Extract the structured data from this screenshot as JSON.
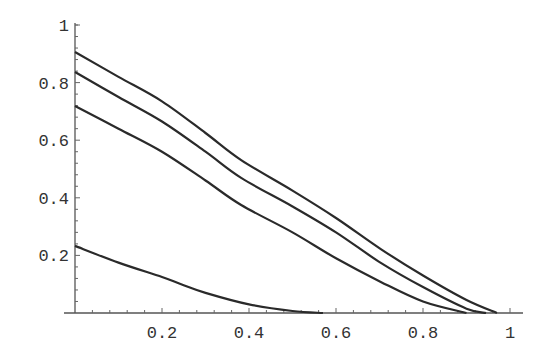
{
  "chart_data": {
    "type": "line",
    "title": "",
    "xlabel": "",
    "ylabel": "",
    "xlim": [
      0,
      1
    ],
    "ylim": [
      0,
      1
    ],
    "grid": false,
    "legend": null,
    "x_ticks": [
      "0.2",
      "0.4",
      "0.6",
      "0.8",
      "1"
    ],
    "y_ticks": [
      "0.2",
      "0.4",
      "0.6",
      "0.8",
      "1"
    ],
    "x_tick_values": [
      0.2,
      0.4,
      0.6,
      0.8,
      1.0
    ],
    "y_tick_values": [
      0.2,
      0.4,
      0.6,
      0.8,
      1.0
    ],
    "series": [
      {
        "name": "curve-1",
        "x": [
          0,
          0.1,
          0.2,
          0.3,
          0.382,
          0.5,
          0.6,
          0.703,
          0.8,
          0.9,
          0.97
        ],
        "y": [
          0.906,
          0.82,
          0.735,
          0.625,
          0.531,
          0.425,
          0.33,
          0.222,
          0.13,
          0.045,
          0.0
        ]
      },
      {
        "name": "curve-2",
        "x": [
          0,
          0.1,
          0.2,
          0.3,
          0.382,
          0.5,
          0.6,
          0.703,
          0.8,
          0.9,
          0.945
        ],
        "y": [
          0.837,
          0.75,
          0.665,
          0.56,
          0.469,
          0.37,
          0.28,
          0.174,
          0.09,
          0.015,
          0.0
        ]
      },
      {
        "name": "curve-3",
        "x": [
          0,
          0.1,
          0.2,
          0.3,
          0.382,
          0.5,
          0.6,
          0.703,
          0.8,
          0.9
        ],
        "y": [
          0.719,
          0.64,
          0.56,
          0.46,
          0.375,
          0.28,
          0.19,
          0.108,
          0.04,
          0.0
        ]
      },
      {
        "name": "curve-4",
        "x": [
          0,
          0.1,
          0.2,
          0.244,
          0.3,
          0.4,
          0.5,
          0.57
        ],
        "y": [
          0.233,
          0.175,
          0.125,
          0.1,
          0.07,
          0.03,
          0.007,
          0.0
        ]
      }
    ]
  }
}
